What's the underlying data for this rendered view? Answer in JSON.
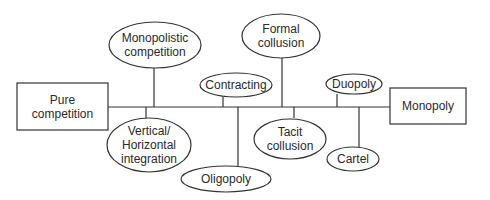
{
  "diagram": {
    "colors": {
      "stroke": "#333333",
      "text": "#2a2a2a",
      "background": "#ffffff"
    },
    "endpoints": {
      "left": {
        "label_lines": [
          "Pure",
          "competition"
        ]
      },
      "right": {
        "label_lines": [
          "Monopoly"
        ]
      }
    },
    "nodes": [
      {
        "id": "monopolistic-competition",
        "position": "above",
        "label_lines": [
          "Monopolistic",
          "competition"
        ]
      },
      {
        "id": "vertical-horizontal-integration",
        "position": "below",
        "label_lines": [
          "Vertical/",
          "Horizontal",
          "integration"
        ]
      },
      {
        "id": "contracting",
        "position": "above",
        "label_lines": [
          "Contracting"
        ]
      },
      {
        "id": "oligopoly",
        "position": "below",
        "label_lines": [
          "Oligopoly"
        ]
      },
      {
        "id": "formal-collusion",
        "position": "above",
        "label_lines": [
          "Formal",
          "collusion"
        ]
      },
      {
        "id": "tacit-collusion",
        "position": "below",
        "label_lines": [
          "Tacit",
          "collusion"
        ]
      },
      {
        "id": "duopoly",
        "position": "above",
        "label_lines": [
          "Duopoly"
        ]
      },
      {
        "id": "cartel",
        "position": "below",
        "label_lines": [
          "Cartel"
        ]
      }
    ]
  }
}
